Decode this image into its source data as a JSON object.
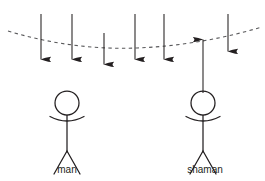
{
  "figure": {
    "title": "",
    "background_color": "#ffffff",
    "stroke_color": "#231f20",
    "curve_color": "#4d4d4d",
    "width": 265,
    "height": 181
  },
  "labels": {
    "man": "man",
    "shaman": "shaman"
  },
  "arrows": [
    {
      "name": "arrow-1",
      "x": 41,
      "y_start": 14,
      "y_end": 70,
      "direction": "down"
    },
    {
      "name": "arrow-2",
      "x": 72,
      "y_start": 14,
      "y_end": 70,
      "direction": "down"
    },
    {
      "name": "arrow-3",
      "x": 104,
      "y_start": 33,
      "y_end": 75,
      "direction": "down"
    },
    {
      "name": "arrow-4",
      "x": 135,
      "y_start": 14,
      "y_end": 70,
      "direction": "down"
    },
    {
      "name": "arrow-5",
      "x": 164,
      "y_start": 14,
      "y_end": 70,
      "direction": "down"
    },
    {
      "name": "arrow-6",
      "x": 203,
      "y_start": 93,
      "y_end": 29,
      "direction": "up"
    },
    {
      "name": "arrow-7",
      "x": 228,
      "y_start": 14,
      "y_end": 62,
      "direction": "down"
    }
  ],
  "curve": {
    "name": "equipotential-curve",
    "style": "dashed",
    "points_left": {
      "x": 8,
      "y": 31
    },
    "points_bottom": {
      "x": 137,
      "y": 48
    },
    "points_right": {
      "x": 262,
      "y": 27
    }
  },
  "people": [
    {
      "name": "man",
      "head_cx": 67,
      "head_cy": 103,
      "head_r": 12,
      "body_top": 115,
      "body_bottom": 152,
      "arm_left_x": 50,
      "arm_right_x": 84,
      "arm_y": 119,
      "leg_left_x": 54,
      "leg_right_x": 80,
      "leg_y": 174,
      "label_x": 67,
      "label_y": 172
    },
    {
      "name": "shaman",
      "head_cx": 203,
      "head_cy": 103,
      "head_r": 12,
      "body_top": 115,
      "body_bottom": 152,
      "arm_left_x": 186,
      "arm_right_x": 220,
      "arm_y": 119,
      "leg_left_x": 190,
      "leg_right_x": 216,
      "leg_y": 174,
      "label_x": 205,
      "label_y": 172
    }
  ]
}
